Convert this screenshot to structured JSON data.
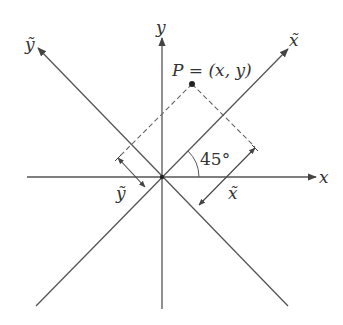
{
  "diagram": {
    "labels": {
      "x_axis": "x",
      "y_axis": "y",
      "x_tilde_axis": "x̃",
      "y_tilde_axis": "ỹ",
      "point": "P = (x, y)",
      "angle": "45°",
      "x_tilde_measure": "x̃",
      "y_tilde_measure": "ỹ"
    },
    "colors": {
      "line": "#444444",
      "dashed": "#666666",
      "text": "#333333"
    },
    "geometry": {
      "origin": [
        163,
        177
      ],
      "point_P": [
        192,
        84
      ],
      "rotation_angle_deg": 45
    }
  }
}
